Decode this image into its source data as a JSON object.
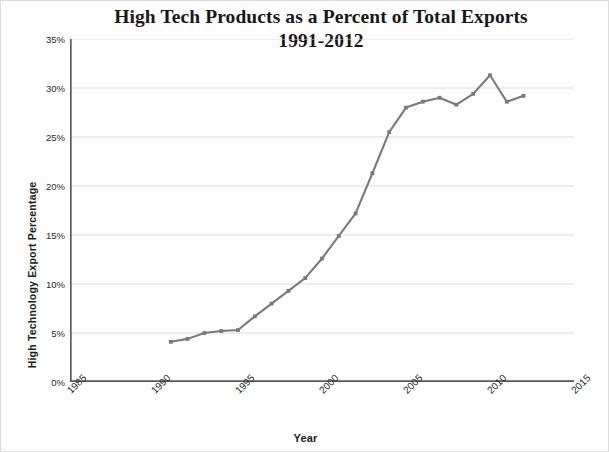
{
  "chart_data": {
    "type": "line",
    "title_line1": "High Tech Products as a Percent of Total Exports",
    "title_line2": "1991-2012",
    "xlabel": "Year",
    "ylabel": "High Technology Export Percentage",
    "xlim": [
      1985,
      2015
    ],
    "ylim": [
      0,
      35
    ],
    "xticks": [
      1985,
      1990,
      1995,
      2000,
      2005,
      2010,
      2015
    ],
    "xtick_labels": [
      "1985",
      "1990",
      "1995",
      "2000",
      "2005",
      "2010",
      "2015"
    ],
    "yticks": [
      0,
      5,
      10,
      15,
      20,
      25,
      30,
      35
    ],
    "ytick_labels": [
      "0%",
      "5%",
      "10%",
      "15%",
      "20%",
      "25%",
      "30%",
      "35%"
    ],
    "grid": "horizontal",
    "legend": "none",
    "markers": true,
    "line_color": "#7a7a7a",
    "grid_color": "#d9d9d9",
    "axis_color": "#595959",
    "series": [
      {
        "name": "High technology exports (% of total exports)",
        "x": [
          1991,
          1992,
          1993,
          1994,
          1995,
          1996,
          1997,
          1998,
          1999,
          2000,
          2001,
          2002,
          2003,
          2004,
          2005,
          2006,
          2007,
          2008,
          2009,
          2010,
          2011,
          2012
        ],
        "values": [
          4.1,
          4.4,
          5.0,
          5.2,
          5.3,
          6.7,
          8.0,
          9.3,
          10.6,
          12.6,
          14.9,
          17.2,
          21.3,
          25.5,
          28.0,
          28.6,
          29.0,
          28.3,
          29.4,
          31.3,
          28.6,
          29.2
        ]
      }
    ]
  }
}
